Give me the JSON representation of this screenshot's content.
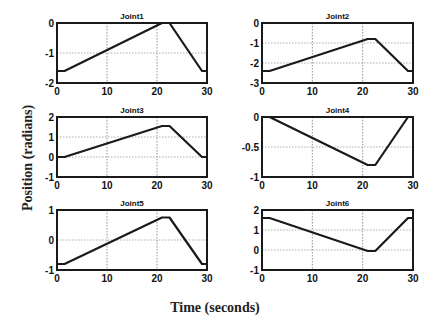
{
  "figure": {
    "ylabel": "Position (radians)",
    "xlabel": "Time (seconds)"
  },
  "chart_data": [
    {
      "type": "line",
      "title": "Joint1",
      "xlabel": "",
      "ylabel": "",
      "xlim": [
        0,
        30
      ],
      "ylim": [
        -2,
        0
      ],
      "xticks": [
        0,
        10,
        20,
        30
      ],
      "yticks": [
        0,
        -1,
        -2
      ],
      "grid": true,
      "x": [
        0,
        1.5,
        21,
        22.5,
        29,
        30
      ],
      "y": [
        -1.6,
        -1.6,
        0,
        0,
        -1.6,
        -1.6
      ]
    },
    {
      "type": "line",
      "title": "Joint2",
      "xlabel": "",
      "ylabel": "",
      "xlim": [
        0,
        30
      ],
      "ylim": [
        -3,
        0
      ],
      "xticks": [
        0,
        10,
        20,
        30
      ],
      "yticks": [
        0,
        -1,
        -2,
        -3
      ],
      "grid": true,
      "x": [
        0,
        1.5,
        21,
        22.5,
        29,
        30
      ],
      "y": [
        -2.4,
        -2.4,
        -0.8,
        -0.8,
        -2.4,
        -2.4
      ]
    },
    {
      "type": "line",
      "title": "Joint3",
      "xlabel": "",
      "ylabel": "",
      "xlim": [
        0,
        30
      ],
      "ylim": [
        -1,
        2
      ],
      "xticks": [
        0,
        10,
        20,
        30
      ],
      "yticks": [
        2,
        1,
        0,
        -1
      ],
      "grid": true,
      "x": [
        0,
        1.5,
        21,
        22.5,
        29,
        30
      ],
      "y": [
        0,
        0,
        1.55,
        1.55,
        0,
        0
      ]
    },
    {
      "type": "line",
      "title": "Joint4",
      "xlabel": "",
      "ylabel": "",
      "xlim": [
        0,
        30
      ],
      "ylim": [
        -1,
        0
      ],
      "xticks": [
        0,
        10,
        20,
        30
      ],
      "yticks": [
        0,
        -0.5,
        -1
      ],
      "grid": true,
      "x": [
        0,
        1.5,
        21,
        22.5,
        29,
        30
      ],
      "y": [
        0,
        0,
        -0.8,
        -0.8,
        0,
        0
      ]
    },
    {
      "type": "line",
      "title": "Joint5",
      "xlabel": "",
      "ylabel": "",
      "xlim": [
        0,
        30
      ],
      "ylim": [
        -1,
        1
      ],
      "xticks": [
        0,
        10,
        20,
        30
      ],
      "yticks": [
        1,
        0,
        -1
      ],
      "grid": true,
      "x": [
        0,
        1.5,
        21,
        22.5,
        29,
        30
      ],
      "y": [
        -0.8,
        -0.8,
        0.75,
        0.75,
        -0.8,
        -0.8
      ]
    },
    {
      "type": "line",
      "title": "Joint6",
      "xlabel": "",
      "ylabel": "",
      "xlim": [
        0,
        30
      ],
      "ylim": [
        -1,
        2
      ],
      "xticks": [
        0,
        10,
        20,
        30
      ],
      "yticks": [
        2,
        1,
        0,
        -1
      ],
      "grid": true,
      "x": [
        0,
        1.5,
        21,
        22.5,
        29,
        30
      ],
      "y": [
        1.6,
        1.6,
        -0.05,
        -0.05,
        1.6,
        1.6
      ]
    }
  ]
}
